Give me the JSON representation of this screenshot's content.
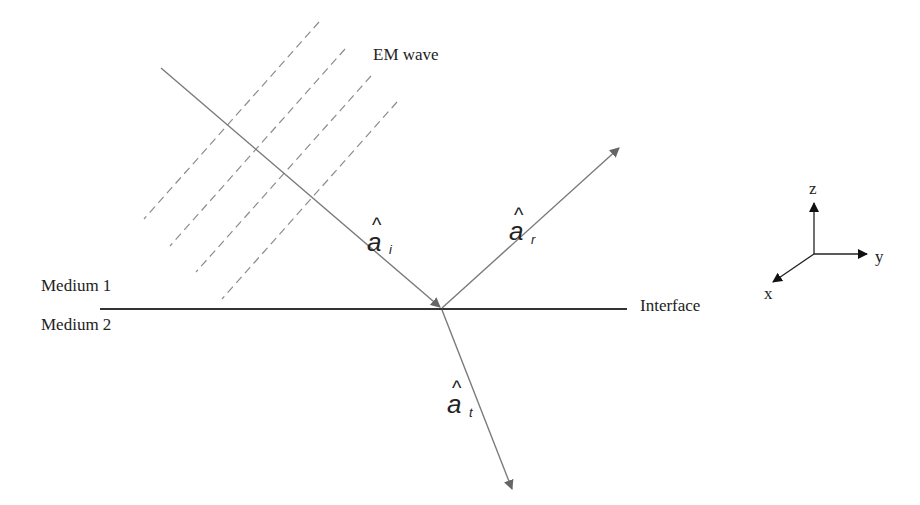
{
  "diagram": {
    "type": "reflection-refraction-at-interface",
    "labels": {
      "em_wave": "EM wave",
      "medium_1": "Medium 1",
      "medium_2": "Medium 2",
      "interface": "Interface"
    },
    "vectors": {
      "incident": {
        "symbol": "a",
        "hat": "^",
        "subscript": "i"
      },
      "reflected": {
        "symbol": "a",
        "hat": "^",
        "subscript": "r"
      },
      "transmitted": {
        "symbol": "a",
        "hat": "^",
        "subscript": "t"
      }
    },
    "axes": {
      "z": "z",
      "y": "y",
      "x": "x"
    },
    "wavefront_count": 4,
    "colors": {
      "ray": "#7a7a7a",
      "wavefront": "#8c8c8c",
      "interface": "#333333",
      "axes": "#222222",
      "text": "#222222"
    }
  }
}
